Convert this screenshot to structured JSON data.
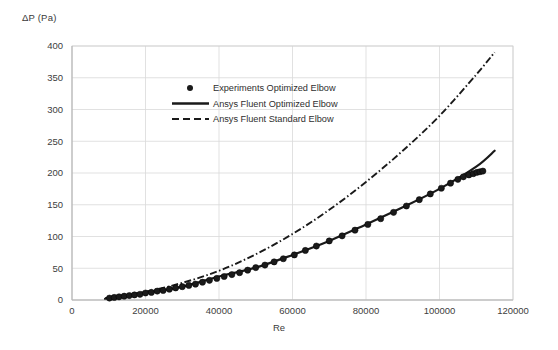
{
  "chart_data": {
    "type": "scatter",
    "title": "",
    "xlabel": "Re",
    "ylabel": "ΔP (Pa)",
    "xlim": [
      0,
      120000
    ],
    "ylim": [
      0,
      400
    ],
    "xticks": [
      0,
      20000,
      40000,
      60000,
      80000,
      100000,
      120000
    ],
    "xtick_labels": [
      "0",
      "20000",
      "40000",
      "60000",
      "80000",
      "100000",
      "120000"
    ],
    "yticks": [
      0,
      50,
      100,
      150,
      200,
      250,
      300,
      350,
      400
    ],
    "ytick_labels": [
      "0",
      "50",
      "100",
      "150",
      "200",
      "250",
      "300",
      "350",
      "400"
    ],
    "grid": true,
    "legend_position": "upper-left-inside",
    "series": [
      {
        "name": "Experiments Optimized Elbow",
        "style": "markers",
        "marker": "filled-circle",
        "color": "#1a1a1a",
        "x": [
          10200,
          11500,
          12800,
          14200,
          15600,
          17000,
          18500,
          20000,
          21600,
          23200,
          24800,
          26500,
          28200,
          30000,
          31800,
          33600,
          35500,
          37400,
          39400,
          41400,
          43500,
          45600,
          47800,
          50000,
          52500,
          55000,
          57500,
          60500,
          63500,
          66500,
          70000,
          73500,
          77000,
          80500,
          84000,
          87500,
          91000,
          94500,
          97500,
          100500,
          103000,
          105000,
          106500,
          108000,
          109200,
          110200,
          111000,
          111800
        ],
        "y": [
          3,
          4,
          5,
          6,
          7,
          8,
          9,
          11,
          12,
          14,
          15,
          17,
          19,
          21,
          23,
          25,
          28,
          31,
          34,
          37,
          40,
          43,
          47,
          51,
          55,
          60,
          65,
          71,
          78,
          85,
          93,
          101,
          110,
          119,
          128,
          138,
          148,
          158,
          167,
          176,
          184,
          190,
          194,
          197,
          199,
          201,
          202,
          203
        ]
      },
      {
        "name": "Ansys Fluent Optimized Elbow",
        "style": "solid-line",
        "color": "#1a1a1a",
        "x": [
          9000,
          20000,
          30000,
          40000,
          50000,
          60000,
          70000,
          80000,
          90000,
          100000,
          110000,
          115000
        ],
        "y": [
          2,
          11,
          21,
          37,
          51,
          71,
          93,
          119,
          146,
          175,
          210,
          235
        ]
      },
      {
        "name": "Ansys Fluent Standard Elbow",
        "style": "dash-dot-line",
        "color": "#1a1a1a",
        "x": [
          9000,
          20000,
          30000,
          40000,
          50000,
          60000,
          70000,
          80000,
          90000,
          100000,
          110000,
          115000
        ],
        "y": [
          3,
          13,
          27,
          46,
          72,
          104,
          142,
          186,
          235,
          290,
          355,
          390
        ]
      }
    ]
  },
  "legend": {
    "items": [
      {
        "label": "Experiments Optimized Elbow",
        "symbol": "filled-circle"
      },
      {
        "label": "Ansys Fluent Optimized Elbow",
        "symbol": "solid-line"
      },
      {
        "label": "Ansys Fluent Standard Elbow",
        "symbol": "dashed-line"
      }
    ]
  },
  "axes": {
    "y_title": "ΔP (Pa)",
    "x_title": "Re"
  }
}
